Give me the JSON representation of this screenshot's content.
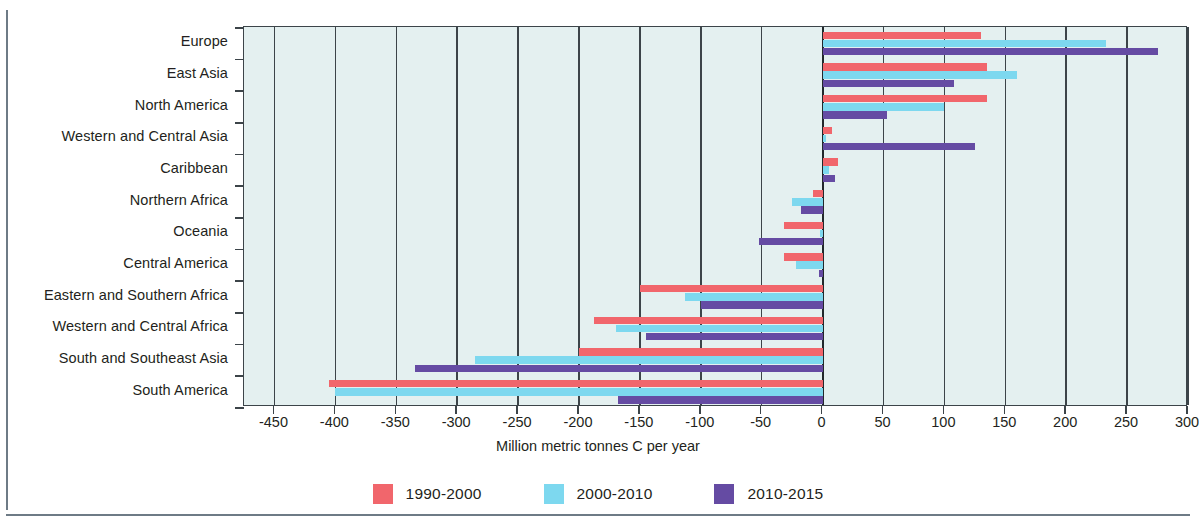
{
  "figure": {
    "cropped_title_fragment": "",
    "axis_title": "Million metric tonnes C per year"
  },
  "legend": {
    "position": "bottom-center",
    "items": [
      {
        "label": "1990-2000",
        "color": "#f1666c"
      },
      {
        "label": "2000-2010",
        "color": "#7dd8ef"
      },
      {
        "label": "2010-2015",
        "color": "#654ba3"
      }
    ]
  },
  "chart_data": {
    "type": "bar",
    "orientation": "horizontal",
    "title": "",
    "subtitle": "",
    "xlabel": "Million metric tonnes C per year",
    "ylabel": "",
    "xlim": [
      -475,
      300
    ],
    "xticks": [
      -450,
      -400,
      -350,
      -300,
      -250,
      -200,
      -150,
      -100,
      -50,
      0,
      50,
      100,
      150,
      200,
      250,
      300
    ],
    "xtick_labels": [
      "-450",
      "-400",
      "-350",
      "-300",
      "-250",
      "-200",
      "-150",
      "-100",
      "-50",
      "0",
      "50",
      "100",
      "150",
      "200",
      "250",
      "300"
    ],
    "grid": "vertical",
    "zero_line": 0,
    "categories": [
      "Europe",
      "East Asia",
      "North America",
      "Western and Central Asia",
      "Caribbean",
      "Northern Africa",
      "Oceania",
      "Central America",
      "Eastern and Southern Africa",
      "Western and Central Africa",
      "South and Southeast Asia",
      "South America"
    ],
    "series": [
      {
        "name": "1990-2000",
        "color": "#f1666c",
        "values": [
          130,
          135,
          135,
          8,
          13,
          -8,
          -32,
          -32,
          -150,
          -188,
          -200,
          -405
        ]
      },
      {
        "name": "2000-2010",
        "color": "#7dd8ef",
        "values": [
          233,
          160,
          100,
          3,
          5,
          -25,
          -2,
          -22,
          -113,
          -170,
          -285,
          -400
        ]
      },
      {
        "name": "2010-2015",
        "color": "#654ba3",
        "values": [
          275,
          108,
          53,
          125,
          10,
          -18,
          -52,
          -3,
          -100,
          -145,
          -335,
          -168
        ]
      }
    ]
  },
  "colors": {
    "plot_background": "#e4f0f0",
    "axis": "#3c4449",
    "text": "#231f20"
  }
}
